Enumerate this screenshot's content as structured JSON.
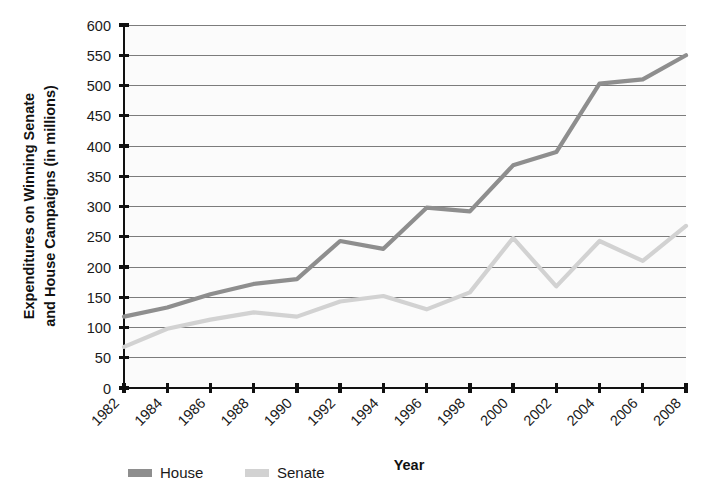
{
  "chart_data": {
    "type": "line",
    "title": "",
    "xlabel": "Year",
    "ylabel": "Expenditures on Winning Senate and House Campaigns (in millions)",
    "categories": [
      "1982",
      "1984",
      "1986",
      "1988",
      "1990",
      "1992",
      "1994",
      "1996",
      "1998",
      "2000",
      "2002",
      "2004",
      "2006",
      "2008"
    ],
    "x": [
      1982,
      1984,
      1986,
      1988,
      1990,
      1992,
      1994,
      1996,
      1998,
      2000,
      2002,
      2004,
      2006,
      2008
    ],
    "series": [
      {
        "name": "House",
        "color": "#8e8e8e",
        "values": [
          118,
          133,
          155,
          172,
          180,
          243,
          230,
          298,
          292,
          368,
          390,
          503,
          510,
          550
        ]
      },
      {
        "name": "Senate",
        "color": "#d2d2d2",
        "values": [
          68,
          98,
          113,
          125,
          118,
          143,
          152,
          130,
          158,
          248,
          168,
          243,
          210,
          268
        ]
      }
    ],
    "ylim": [
      0,
      600
    ],
    "ytick_step": 50,
    "yticks": [
      "0",
      "50",
      "100",
      "150",
      "200",
      "250",
      "300",
      "350",
      "400",
      "450",
      "500",
      "550",
      "600"
    ],
    "grid": true,
    "legend_position": "bottom-left",
    "xtick_rotation": -45
  },
  "legend": {
    "entries": [
      {
        "label": "House",
        "color": "#8e8e8e"
      },
      {
        "label": "Senate",
        "color": "#d2d2d2"
      }
    ]
  }
}
